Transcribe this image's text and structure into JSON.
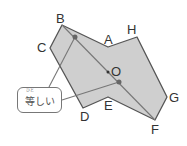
{
  "diagram": {
    "type": "point-symmetric figure",
    "center_label": "O",
    "vertices": [
      {
        "label": "A",
        "x": 108,
        "y": 47
      },
      {
        "label": "H",
        "x": 137,
        "y": 37
      },
      {
        "label": "G",
        "x": 167,
        "y": 97
      },
      {
        "label": "F",
        "x": 155,
        "y": 120
      },
      {
        "label": "E",
        "x": 108,
        "y": 97
      },
      {
        "label": "D",
        "x": 83,
        "y": 108
      },
      {
        "label": "C",
        "x": 50,
        "y": 48
      },
      {
        "label": "B",
        "x": 62,
        "y": 25
      }
    ],
    "callout": {
      "text": "等しい",
      "ruby": "ひと"
    },
    "colors": {
      "fill": "#cfcfcf",
      "stroke": "#555555",
      "line": "#777777"
    }
  }
}
